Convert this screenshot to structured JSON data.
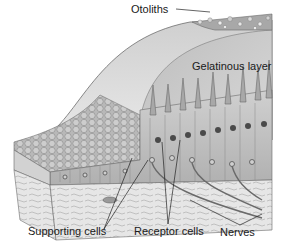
{
  "diagram": {
    "labels": {
      "otoliths": "Otoliths",
      "gelatinous_layer": "Gelatinous layer",
      "supporting_cells": "Supporting cells",
      "receptor_cells": "Receptor cells",
      "nerves": "Nerves"
    },
    "colors": {
      "background": "#ffffff",
      "gelatinous": "#d8d8d8",
      "gelatinous_inner": "#c8c8c8",
      "cells": "#bdbdbd",
      "connective": "#e4e4e4",
      "nucleus": "#4a4a4a",
      "line": "#333333"
    }
  }
}
